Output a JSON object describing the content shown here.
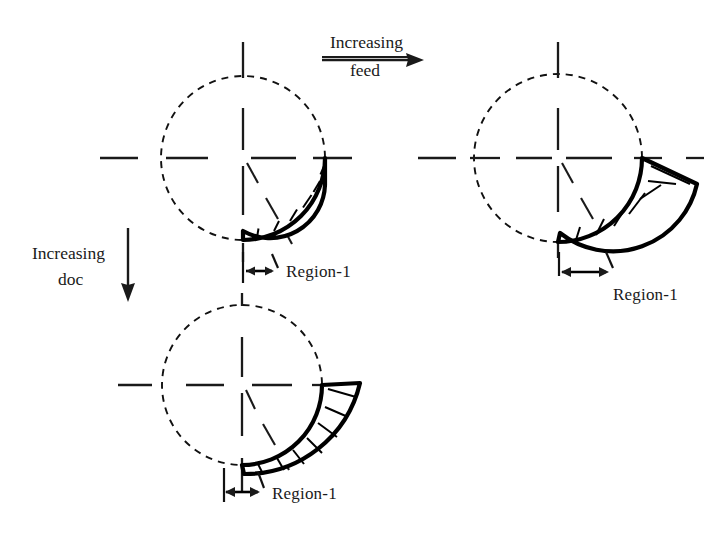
{
  "figure": {
    "background_color": "#ffffff",
    "line_color": "#1a1a1a",
    "hatch_color": "#000000"
  },
  "annotations": {
    "feed_axis": {
      "line1": "Increasing",
      "line2": "feed",
      "direction": "right",
      "arrow_icon": "arrow-right-icon"
    },
    "doc_axis": {
      "line1": "Increasing",
      "line2": "doc",
      "direction": "down",
      "arrow_icon": "arrow-down-icon"
    }
  },
  "diagrams": [
    {
      "id": "diagram-top-left",
      "position": "top-left",
      "condition": "baseline feed, baseline doc",
      "region_label": "Region-1",
      "region_width_px": 32,
      "circle": {
        "cx": 243,
        "cy": 158,
        "r": 82
      },
      "crescent": {
        "arc_span_deg": 62,
        "max_thickness_px": 17
      }
    },
    {
      "id": "diagram-top-right",
      "position": "top-right",
      "condition": "increased feed",
      "region_label": "Region-1",
      "region_width_px": 52,
      "circle": {
        "cx": 558,
        "cy": 158,
        "r": 84
      },
      "crescent": {
        "arc_span_deg": 62,
        "max_thickness_px": 30
      }
    },
    {
      "id": "diagram-bottom-left",
      "position": "bottom-left",
      "condition": "increased doc",
      "region_label": "Region-1",
      "region_width_px": 34,
      "circle": {
        "cx": 242,
        "cy": 385,
        "r": 80
      },
      "crescent": {
        "arc_span_deg": 90,
        "max_thickness_px": 30
      }
    }
  ]
}
